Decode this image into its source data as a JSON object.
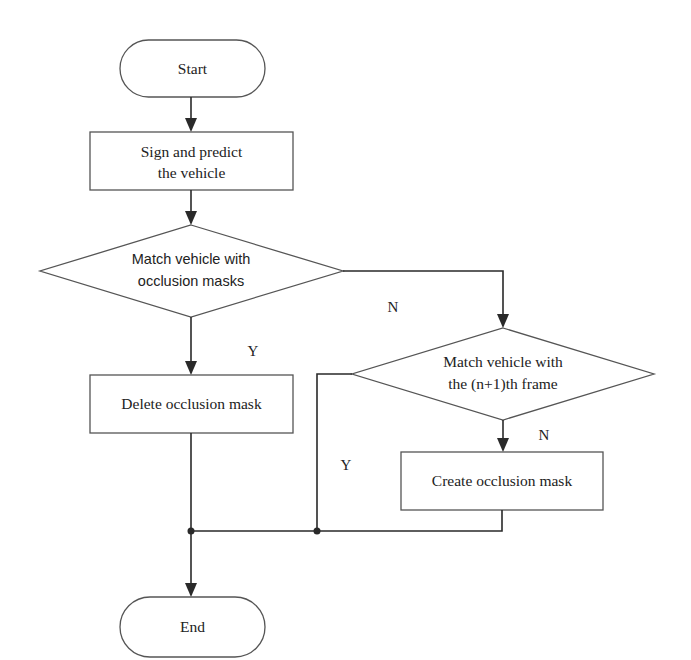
{
  "diagram": {
    "type": "flowchart",
    "nodes": {
      "start": {
        "label": "Start",
        "shape": "terminator"
      },
      "sign_predict": {
        "label_line1": "Sign and predict",
        "label_line2": "the vehicle",
        "shape": "process"
      },
      "match_masks": {
        "label_line1": "Match vehicle with",
        "label_line2": "occlusion masks",
        "shape": "decision"
      },
      "delete_mask": {
        "label": "Delete occlusion mask",
        "shape": "process"
      },
      "match_next_frame": {
        "label_line1": "Match vehicle with",
        "label_line2": "the (n+1)th frame",
        "shape": "decision"
      },
      "create_mask": {
        "label": "Create occlusion mask",
        "shape": "process"
      },
      "end": {
        "label": "End",
        "shape": "terminator"
      }
    },
    "edge_labels": {
      "match_masks_no": "N",
      "match_masks_yes": "Y",
      "match_next_frame_no": "N",
      "match_next_frame_yes": "Y"
    },
    "edges": [
      {
        "from": "start",
        "to": "sign_predict"
      },
      {
        "from": "sign_predict",
        "to": "match_masks"
      },
      {
        "from": "match_masks",
        "to": "delete_mask",
        "label": "Y"
      },
      {
        "from": "match_masks",
        "to": "match_next_frame",
        "label": "N"
      },
      {
        "from": "match_next_frame",
        "to": "create_mask",
        "label": "N"
      },
      {
        "from": "match_next_frame",
        "to": "end",
        "label": "Y"
      },
      {
        "from": "delete_mask",
        "to": "end"
      },
      {
        "from": "create_mask",
        "to": "end"
      }
    ],
    "colors": {
      "line": "#2a2a2a",
      "shape_stroke": "#555555",
      "background": "#ffffff"
    }
  }
}
